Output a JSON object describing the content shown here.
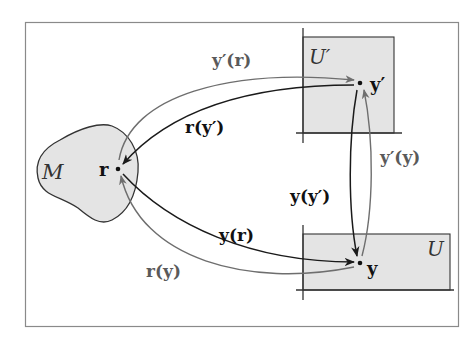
{
  "diagram": {
    "regions": {
      "M": {
        "label": "M"
      },
      "U_prime": {
        "label": "U′"
      },
      "U": {
        "label": "U"
      }
    },
    "points": {
      "r": {
        "label": "r"
      },
      "y_prime": {
        "label": "y′"
      },
      "y": {
        "label": "y"
      }
    },
    "arrows": {
      "y_prime_of_r": {
        "label": "y′(r)"
      },
      "r_of_y_prime": {
        "label": "r(y′)"
      },
      "y_of_r": {
        "label": "y(r)"
      },
      "r_of_y": {
        "label": "r(y)"
      },
      "y_of_y_prime": {
        "label": "y(y′)"
      },
      "y_prime_of_y": {
        "label": "y′(y)"
      }
    },
    "colors": {
      "frame": "#8a8a8a",
      "region_fill": "#e4e4e4",
      "dark_arrow": "#1a1a1a",
      "gray_arrow": "#6e6e6e",
      "label_dark": "#111111",
      "label_gray": "#5a5a5a"
    }
  }
}
